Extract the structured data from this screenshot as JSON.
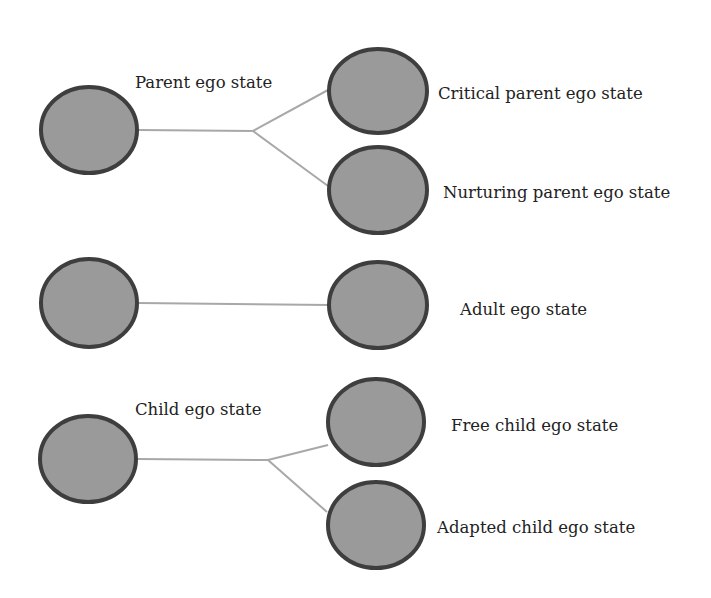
{
  "diagram": {
    "title": "",
    "colors": {
      "node_fill": "#9a9a9a",
      "node_stroke": "#3e3e3e",
      "connector": "#a8a8a8",
      "text": "#222222"
    },
    "groups": [
      {
        "id": "parent",
        "label": "Parent ego state",
        "children": [
          {
            "label": "Critical parent ego state"
          },
          {
            "label": "Nurturing parent ego state"
          }
        ]
      },
      {
        "id": "adult",
        "label": "",
        "children": [
          {
            "label": "Adult ego state"
          }
        ]
      },
      {
        "id": "child",
        "label": "Child ego state",
        "children": [
          {
            "label": "Free child ego state"
          },
          {
            "label": "Adapted child ego state"
          }
        ]
      }
    ]
  }
}
